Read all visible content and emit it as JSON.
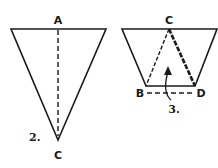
{
  "figures": [
    {
      "step_label": "2.",
      "points": {
        "top": "A",
        "bottom": "C"
      },
      "description": "Inverted triangle folded along dashed vertical line from A to C"
    },
    {
      "step_label": "3.",
      "points": {
        "top": "C",
        "left": "B",
        "right": "D"
      },
      "description": "Trapezoid with inner triangle C-B-D; dashed fold line B-D; curved arrow indicating upward fold"
    }
  ],
  "colors": {
    "ink": "#1a1a1a",
    "background": "#ffffff"
  }
}
